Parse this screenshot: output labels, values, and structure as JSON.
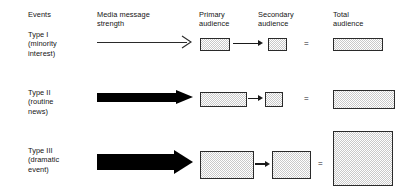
{
  "figure": {
    "columns": [
      {
        "id": "events",
        "label": "Events",
        "x": 28,
        "y": 10
      },
      {
        "id": "media-strength",
        "label": "Media message\nstrength",
        "x": 97,
        "y": 10
      },
      {
        "id": "primary",
        "label": "Primary\naudience",
        "x": 199,
        "y": 10
      },
      {
        "id": "secondary",
        "label": "Secondary\naudience",
        "x": 258,
        "y": 10
      },
      {
        "id": "total",
        "label": "Total\naudience",
        "x": 333,
        "y": 10
      }
    ],
    "equals_symbol": "=",
    "rows": [
      {
        "id": "type-1",
        "label": "Type I\n(minority\ninterest)",
        "label_x": 28,
        "label_y": 30,
        "arrow": {
          "style": "thin",
          "x": 97,
          "y": 42,
          "w": 96,
          "thickness": 1
        },
        "primary": {
          "x": 200,
          "y": 38,
          "w": 28,
          "h": 11
        },
        "secondary": {
          "x": 268,
          "y": 38,
          "w": 17,
          "h": 11
        },
        "total": {
          "x": 333,
          "y": 38,
          "w": 48,
          "h": 11
        },
        "mini_arrow": {
          "x": 233,
          "y": 43,
          "w": 30
        },
        "equals": {
          "x": 304,
          "y": 40
        }
      },
      {
        "id": "type-2",
        "label": "Type II\n(routine\nnews)",
        "label_x": 28,
        "label_y": 88,
        "arrow": {
          "style": "block",
          "x": 97,
          "y": 93,
          "w": 96,
          "thickness": 9
        },
        "primary": {
          "x": 200,
          "y": 92,
          "w": 45,
          "h": 13
        },
        "secondary": {
          "x": 265,
          "y": 92,
          "w": 16,
          "h": 13
        },
        "total": {
          "x": 333,
          "y": 90,
          "w": 60,
          "h": 17
        },
        "mini_arrow": {
          "x": 248,
          "y": 98,
          "w": 15
        },
        "equals": {
          "x": 304,
          "y": 95
        }
      },
      {
        "id": "type-3",
        "label": "Type III\n(dramatic\nevent)",
        "label_x": 28,
        "label_y": 146,
        "arrow": {
          "style": "block",
          "x": 97,
          "y": 150,
          "w": 96,
          "thickness": 16
        },
        "primary": {
          "x": 200,
          "y": 151,
          "w": 52,
          "h": 26
        },
        "secondary": {
          "x": 272,
          "y": 151,
          "w": 37,
          "h": 26
        },
        "total": {
          "x": 333,
          "y": 131,
          "w": 58,
          "h": 53
        },
        "mini_arrow": {
          "x": 255,
          "y": 164,
          "w": 15
        },
        "equals": {
          "x": 318,
          "y": 160
        }
      }
    ]
  }
}
